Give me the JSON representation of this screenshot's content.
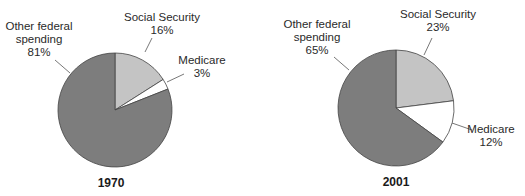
{
  "chart_data": [
    {
      "type": "pie",
      "title": "1970",
      "categories": [
        "Social Security",
        "Medicare",
        "Other federal spending"
      ],
      "values": [
        16,
        3,
        81
      ],
      "unit": "%",
      "labels": {
        "ss_name": "Social Security",
        "ss_value": "16%",
        "med_name": "Medicare",
        "med_value": "3%",
        "other_name_1": "Other federal",
        "other_name_2": "spending",
        "other_value": "81%"
      },
      "colors": [
        "#c4c4c4",
        "#ffffff",
        "#7d7d7d"
      ]
    },
    {
      "type": "pie",
      "title": "2001",
      "categories": [
        "Social Security",
        "Medicare",
        "Other federal spending"
      ],
      "values": [
        23,
        12,
        65
      ],
      "unit": "%",
      "labels": {
        "ss_name": "Social Security",
        "ss_value": "23%",
        "med_name": "Medicare",
        "med_value": "12%",
        "other_name_1": "Other federal",
        "other_name_2": "spending",
        "other_value": "65%"
      },
      "colors": [
        "#c4c4c4",
        "#ffffff",
        "#7d7d7d"
      ]
    }
  ]
}
